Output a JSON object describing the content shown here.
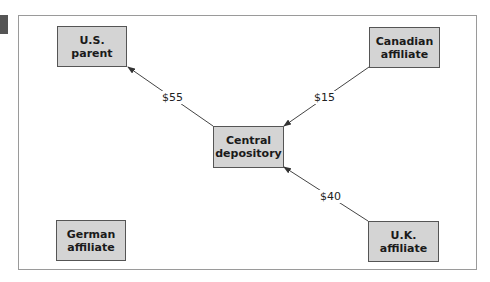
{
  "diagram": {
    "nodes": [
      {
        "id": "us_parent",
        "line1": "U.S.",
        "line2": "parent"
      },
      {
        "id": "canadian_affiliate",
        "line1": "Canadian",
        "line2": "affiliate"
      },
      {
        "id": "central_depository",
        "line1": "Central",
        "line2": "depository"
      },
      {
        "id": "german_affiliate",
        "line1": "German",
        "line2": "affiliate"
      },
      {
        "id": "uk_affiliate",
        "line1": "U.K.",
        "line2": "affiliate"
      }
    ],
    "edges": [
      {
        "from": "central_depository",
        "to": "us_parent",
        "label": "$55"
      },
      {
        "from": "canadian_affiliate",
        "to": "central_depository",
        "label": "$15"
      },
      {
        "from": "uk_affiliate",
        "to": "central_depository",
        "label": "$40"
      }
    ],
    "colors": {
      "box_fill": "#d4d4d4",
      "box_border": "#555555",
      "frame_border": "#9a9a9a",
      "arrow": "#333333"
    }
  }
}
